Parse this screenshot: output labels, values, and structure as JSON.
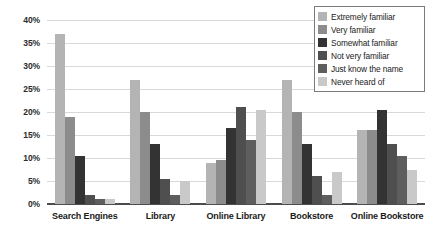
{
  "chart_data": {
    "type": "bar",
    "title": "",
    "xlabel": "",
    "ylabel": "",
    "ylim": [
      0,
      40
    ],
    "ytick_labels": [
      "40%",
      "35%",
      "30%",
      "25%",
      "20%",
      "15%",
      "10%",
      "5%",
      "0%"
    ],
    "ytick_values": [
      40,
      35,
      30,
      25,
      20,
      15,
      10,
      5,
      0
    ],
    "grid": true,
    "legend_position": "top-right",
    "categories": [
      "Search Engines",
      "Library",
      "Online Library",
      "Bookstore",
      "Online Bookstore"
    ],
    "series": [
      {
        "name": "Extremely familiar",
        "color": "#b4b4b4",
        "values": [
          37.0,
          27.0,
          9.0,
          27.0,
          16.0
        ]
      },
      {
        "name": "Very familiar",
        "color": "#8c8c8c",
        "values": [
          19.0,
          20.0,
          9.5,
          20.0,
          16.0
        ]
      },
      {
        "name": "Somewhat familiar",
        "color": "#333333",
        "values": [
          10.5,
          13.0,
          16.5,
          13.0,
          20.5
        ]
      },
      {
        "name": "Not very familiar",
        "color": "#4f4f4f",
        "values": [
          2.0,
          5.5,
          21.0,
          6.0,
          13.0
        ]
      },
      {
        "name": "Just know the name",
        "color": "#5e5e5e",
        "values": [
          1.0,
          2.0,
          14.0,
          2.0,
          10.5
        ]
      },
      {
        "name": "Never heard of",
        "color": "#c9c9c9",
        "values": [
          1.0,
          5.0,
          20.5,
          7.0,
          7.5
        ]
      }
    ]
  },
  "legend": {
    "items": [
      {
        "label": "Extremely familiar"
      },
      {
        "label": "Very familiar"
      },
      {
        "label": "Somewhat familiar"
      },
      {
        "label": "Not very familiar"
      },
      {
        "label": "Just know the name"
      },
      {
        "label": "Never heard of"
      }
    ]
  }
}
